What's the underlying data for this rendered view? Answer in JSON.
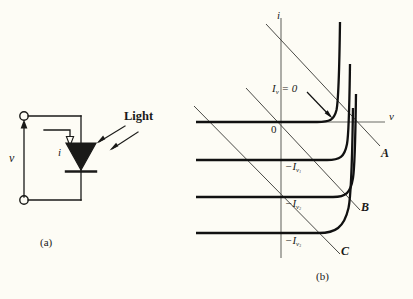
{
  "figure": {
    "background_color": "#fdfcf5",
    "ink_color": "#1a1a18",
    "panel_a": {
      "caption": "(a)",
      "voltage_label": "v",
      "current_label": "i",
      "light_label": "Light",
      "component": "photodiode"
    },
    "panel_b": {
      "caption": "(b)",
      "axis_current_label": "i",
      "axis_voltage_label": "v",
      "origin_label": "0",
      "curve_labels": [
        "I",
        "= 0"
      ],
      "illumination_zero_label": "Iν = 0",
      "level_labels": [
        "−Iν1",
        "−Iν2",
        "−Iν3"
      ],
      "loadline_labels": [
        "A",
        "B",
        "C"
      ]
    }
  },
  "chart_data": {
    "type": "line",
    "title": "",
    "xlabel": "v",
    "ylabel": "i",
    "xlim": [
      -100,
      100
    ],
    "ylim": [
      -100,
      60
    ],
    "grid": false,
    "legend": "none",
    "annotations": [
      {
        "text": "Iν = 0",
        "role": "curve-label",
        "x": -22,
        "y": 22
      },
      {
        "text": "0",
        "role": "origin",
        "x": -6,
        "y": -8
      },
      {
        "text": "−Iν1",
        "role": "y-tick",
        "x": 4,
        "y": -30
      },
      {
        "text": "−Iν2",
        "role": "y-tick",
        "x": 4,
        "y": -58
      },
      {
        "text": "−Iν3",
        "role": "y-tick",
        "x": 4,
        "y": -84
      },
      {
        "text": "A",
        "role": "loadline-label",
        "x": 86,
        "y": -25
      },
      {
        "text": "B",
        "role": "loadline-label",
        "x": 68,
        "y": -58
      },
      {
        "text": "C",
        "role": "loadline-label",
        "x": 48,
        "y": -88
      }
    ],
    "series": [
      {
        "name": "Iν = 0",
        "saturation_current": 0,
        "knee_v": 52
      },
      {
        "name": "−Iν1",
        "saturation_current": -30,
        "knee_v": 56
      },
      {
        "name": "−Iν2",
        "saturation_current": -58,
        "knee_v": 58
      },
      {
        "name": "−Iν3",
        "saturation_current": -84,
        "knee_v": 60
      }
    ],
    "load_lines": [
      {
        "name": "A",
        "x_intercept": 90,
        "y_intercept": 96
      },
      {
        "name": "B",
        "x_intercept": 66,
        "y_intercept": 72
      },
      {
        "name": "C",
        "x_intercept": 44,
        "y_intercept": 48
      }
    ]
  }
}
